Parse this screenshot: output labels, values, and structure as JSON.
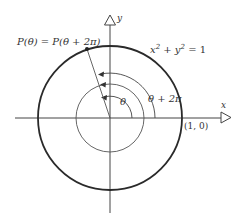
{
  "diagram": {
    "labels": {
      "point": "P(θ) = P(θ + 2π)",
      "circle_eq_base": "x",
      "circle_eq_rest": " + y",
      "circle_eq_tail": " = 1",
      "circle_eq_exp": "2",
      "theta": "θ",
      "theta_plus": "θ + 2π",
      "x_axis": "x",
      "y_axis": "y",
      "point_on_axis": "(1, 0)"
    },
    "colors": {
      "ink": "#333333",
      "circle": "#2a2a2a",
      "background": "#ffffff"
    }
  }
}
